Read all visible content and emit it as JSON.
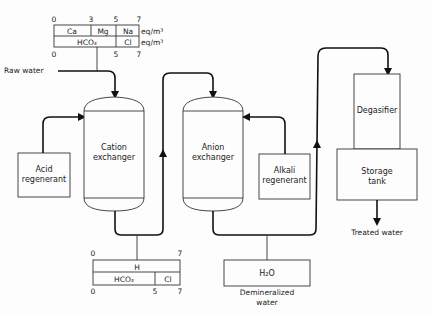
{
  "colors": {
    "line": "#111111",
    "background": "#fdfdfd",
    "text": "#222222"
  },
  "raw_water": {
    "label": "Raw water",
    "scale_top": [
      "0",
      "3",
      "5",
      "7"
    ],
    "scale_bottom": [
      "0",
      "5",
      "7"
    ],
    "row1": {
      "cells": [
        "Ca",
        "Mg",
        "Na"
      ],
      "unit": "eq/m³"
    },
    "row2": {
      "cells": [
        "HCO₃",
        "Cl"
      ],
      "unit": "eq/m³"
    }
  },
  "units": {
    "acid_regenerant": {
      "line1": "Acid",
      "line2": "regenerant"
    },
    "cation_exchanger": {
      "line1": "Cation",
      "line2": "exchanger"
    },
    "anion_exchanger": {
      "line1": "Anion",
      "line2": "exchanger"
    },
    "alkali_regenerant": {
      "line1": "Alkali",
      "line2": "regenerant"
    },
    "degasifier": {
      "label": "Degasifier"
    },
    "storage_tank": {
      "line1": "Storage",
      "line2": "tank"
    }
  },
  "cation_effluent": {
    "scale_top": [
      "0",
      "7"
    ],
    "scale_bottom": [
      "0",
      "5",
      "7"
    ],
    "row1": {
      "cells": [
        "H"
      ]
    },
    "row2": {
      "cells": [
        "HCO₃",
        "Cl"
      ]
    }
  },
  "demineralized": {
    "box_label": "H₂O",
    "line1": "Demineralized",
    "line2": "water"
  },
  "outputs": {
    "treated_water": "Treated water"
  }
}
